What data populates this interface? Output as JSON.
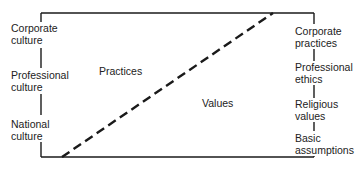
{
  "diagram": {
    "type": "culture-layers",
    "colors": {
      "line": "#1a1a1a",
      "background": "#ffffff",
      "text": "#222222"
    },
    "regions": {
      "upper_left": "Practices",
      "lower_right": "Values"
    },
    "left_axis": {
      "labels": [
        {
          "line1": "Corporate",
          "line2": "culture"
        },
        {
          "line1": "Professional",
          "line2": "culture"
        },
        {
          "line1": "National",
          "line2": "culture"
        }
      ]
    },
    "right_axis": {
      "labels": [
        {
          "line1": "Corporate",
          "line2": "practices"
        },
        {
          "line1": "Professional",
          "line2": "ethics"
        },
        {
          "line1": "Religious",
          "line2": "values"
        },
        {
          "line1": "Basic",
          "line2": "assumptions"
        }
      ]
    },
    "divider": {
      "style": "dashed",
      "from": [
        62,
        157
      ],
      "to": [
        273,
        13
      ]
    }
  }
}
